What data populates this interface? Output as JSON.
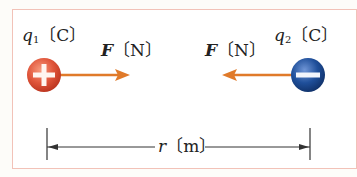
{
  "diagram": {
    "type": "coulomb-force-between-two-charges",
    "charge1": {
      "symbol": "q",
      "subscript": "1",
      "unit": "〔C〕",
      "sign": "+",
      "color": "#e0553a"
    },
    "charge2": {
      "symbol": "q",
      "subscript": "2",
      "unit": "〔C〕",
      "sign": "−",
      "color": "#1f4f9a"
    },
    "force1": {
      "symbol": "F",
      "unit": "〔N〕",
      "direction": "right",
      "color": "#e07a2a"
    },
    "force2": {
      "symbol": "F",
      "unit": "〔N〕",
      "direction": "left",
      "color": "#e07a2a"
    },
    "distance": {
      "symbol": "r",
      "unit": "〔m〕"
    },
    "colors": {
      "frame_border": "#f2c2b8",
      "line": "#333333"
    }
  }
}
